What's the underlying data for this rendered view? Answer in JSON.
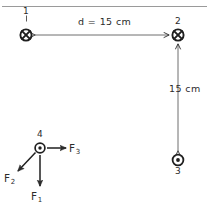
{
  "figure": {
    "background_color": "#ffffff",
    "ink_color": "#2b2b2b",
    "top_rule": true
  },
  "charges": [
    {
      "id": "charge-1",
      "label": "1",
      "symbol": "x-in-circle",
      "direction": "into-page",
      "label_position": "above",
      "x": 26,
      "y": 35
    },
    {
      "id": "charge-2",
      "label": "2",
      "symbol": "x-in-circle",
      "direction": "into-page",
      "label_position": "above",
      "x": 178,
      "y": 35
    },
    {
      "id": "charge-3",
      "label": "3",
      "symbol": "dot-in-circle",
      "direction": "out-of-page",
      "label_position": "below",
      "x": 178,
      "y": 160
    },
    {
      "id": "charge-4",
      "label": "4",
      "symbol": "dot-in-circle",
      "direction": "out-of-page",
      "label_position": "above",
      "x": 40,
      "y": 148
    }
  ],
  "dimensions": [
    {
      "id": "horizontal-distance",
      "text": "d = 15 cm",
      "orientation": "horizontal",
      "from": "charge-1",
      "to": "charge-2",
      "value": 15,
      "unit": "cm"
    },
    {
      "id": "vertical-distance",
      "text": "15 cm",
      "orientation": "vertical",
      "from": "charge-2",
      "to": "charge-3",
      "value": 15,
      "unit": "cm"
    }
  ],
  "forces": [
    {
      "id": "force-1",
      "name": "F",
      "subscript": "1",
      "direction": "down",
      "angle_deg": 270,
      "acts_on": "charge-4"
    },
    {
      "id": "force-2",
      "name": "F",
      "subscript": "2",
      "direction": "down-left",
      "angle_deg": 218,
      "acts_on": "charge-4"
    },
    {
      "id": "force-3",
      "name": "F",
      "subscript": "3",
      "direction": "right",
      "angle_deg": 0,
      "acts_on": "charge-4"
    }
  ]
}
